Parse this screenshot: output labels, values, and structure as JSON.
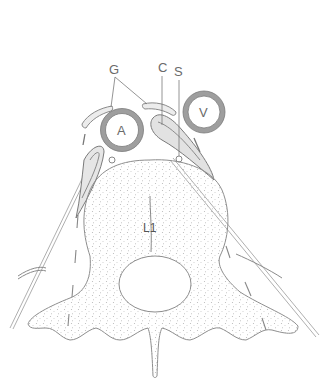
{
  "figure": {
    "labels": {
      "ganglion": "G",
      "crus": "C",
      "splanchnic": "S",
      "aorta": "A",
      "vena_cava": "V",
      "vertebra": "L1"
    },
    "colors": {
      "ink": "#8a8a8a",
      "vessel_ring": "#a0a0a0",
      "bone_stipple": "#b5b5b5",
      "background": "#ffffff"
    }
  }
}
